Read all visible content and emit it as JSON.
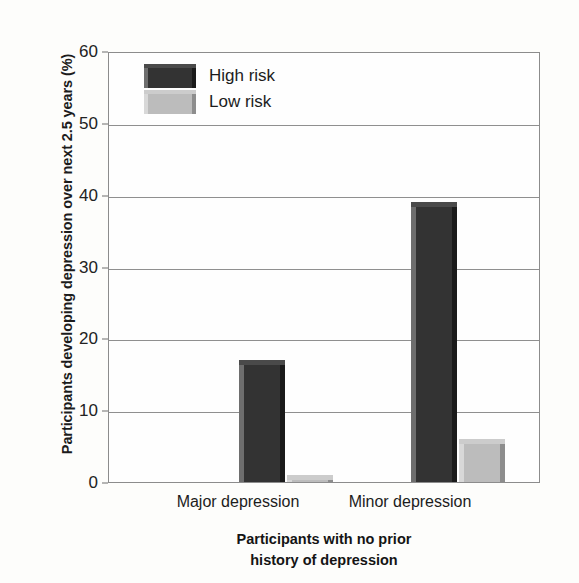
{
  "chart_data": {
    "type": "bar",
    "title": "",
    "categories": [
      "Major depression",
      "Minor depression"
    ],
    "series": [
      {
        "name": "High risk",
        "values": [
          17,
          39
        ],
        "color": "#333333"
      },
      {
        "name": "Low risk",
        "values": [
          1,
          6
        ],
        "color": "#bcbcbc"
      }
    ],
    "xlabel": "Participants with no prior history of depression",
    "xlabel_lines": [
      "Participants with no prior",
      "history of depression"
    ],
    "ylabel": "Participants developing depression over next 2.5 years (%)",
    "ylim": [
      0,
      60
    ],
    "yticks": [
      0,
      10,
      20,
      30,
      40,
      50,
      60
    ],
    "ytick_labels": [
      "0",
      "10",
      "20",
      "30",
      "40",
      "50",
      "60"
    ],
    "grid": true,
    "grid_axis": "y",
    "legend_position": "upper left inside plot"
  },
  "legend": {
    "entries": [
      {
        "label": "High risk"
      },
      {
        "label": "Low risk"
      }
    ]
  },
  "axes": {
    "y_title": "Participants developing depression over next 2.5 years (%)",
    "x_title_line1": "Participants with no prior",
    "x_title_line2": "history of depression",
    "tick_0": "0",
    "tick_10": "10",
    "tick_20": "20",
    "tick_30": "30",
    "tick_40": "40",
    "tick_50": "50",
    "tick_60": "60"
  },
  "categories": {
    "major": "Major depression",
    "minor": "Minor depression"
  }
}
